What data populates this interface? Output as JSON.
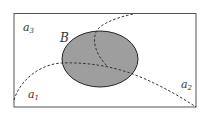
{
  "diagram": {
    "region_labels": {
      "a3": {
        "base": "a",
        "sub": "3"
      },
      "a1": {
        "base": "a",
        "sub": "1"
      },
      "a2": {
        "base": "a",
        "sub": "2"
      }
    },
    "set_label": "B",
    "colors": {
      "frame": "#555555",
      "ellipse_fill": "#9e9e9e",
      "ellipse_stroke": "#222222",
      "dash": "#333333"
    }
  }
}
